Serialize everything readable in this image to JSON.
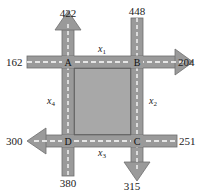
{
  "diagram": {
    "type": "traffic-flow-network",
    "colors": {
      "road": "#9a9a9a",
      "road_edge": "#6e6e6e",
      "lane_marking": "#ffffff",
      "block": "#a8a8a8",
      "block_border": "#3c3c3c",
      "text": "#222222",
      "background": "#ffffff"
    },
    "nodes": [
      {
        "id": "A",
        "label": "A"
      },
      {
        "id": "B",
        "label": "B"
      },
      {
        "id": "C",
        "label": "C"
      },
      {
        "id": "D",
        "label": "D"
      }
    ],
    "external_flows": [
      {
        "node": "A",
        "direction": "out-up",
        "value": "422"
      },
      {
        "node": "A",
        "direction": "in-left",
        "value": "162"
      },
      {
        "node": "B",
        "direction": "in-top",
        "value": "448"
      },
      {
        "node": "B",
        "direction": "out-right",
        "value": "204"
      },
      {
        "node": "C",
        "direction": "in-right",
        "value": "251"
      },
      {
        "node": "C",
        "direction": "out-down",
        "value": "315"
      },
      {
        "node": "D",
        "direction": "out-left",
        "value": "300"
      },
      {
        "node": "D",
        "direction": "in-bottom",
        "value": "380"
      }
    ],
    "internal_edges": [
      {
        "from": "A",
        "to": "B",
        "var": "x",
        "sub": "1"
      },
      {
        "from": "B",
        "to": "C",
        "var": "x",
        "sub": "2"
      },
      {
        "from": "C",
        "to": "D",
        "var": "x",
        "sub": "3"
      },
      {
        "from": "D",
        "to": "A",
        "var": "x",
        "sub": "4"
      }
    ]
  }
}
